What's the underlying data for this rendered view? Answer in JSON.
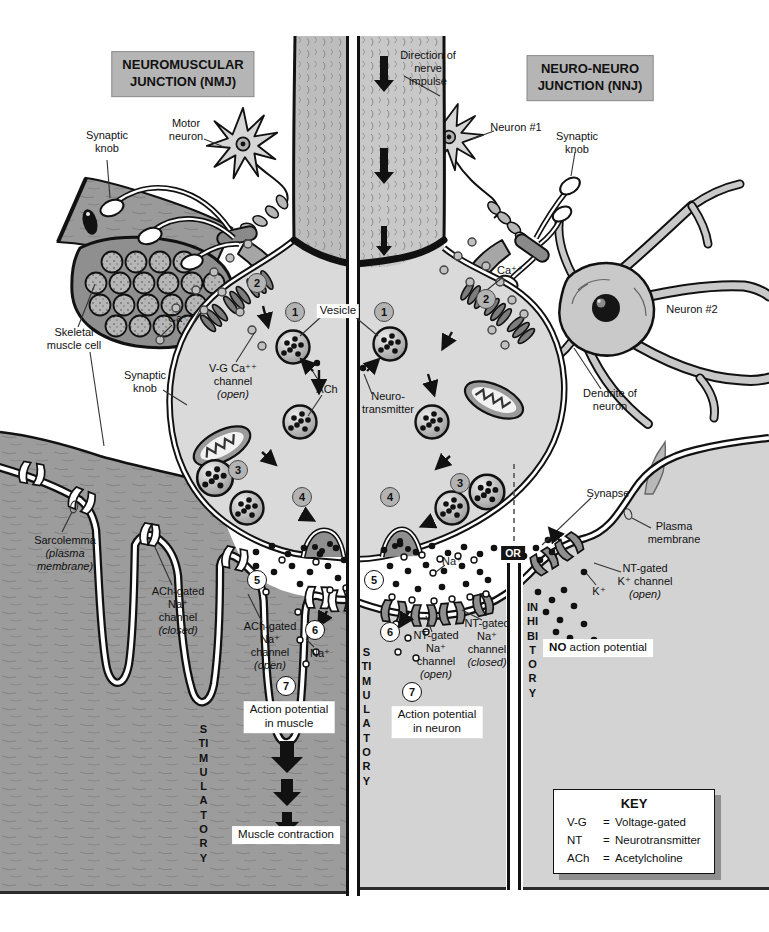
{
  "colors": {
    "page_bg": "#ffffff",
    "muscle_gray": "#9c9c9c",
    "dendrite_gray": "#d3d3d3",
    "knob_gray": "#dadada",
    "header_bg": "#b5b5b5",
    "badge_bg": "#151515",
    "ink": "#111111"
  },
  "titles": {
    "nmj": "NEUROMUSCULAR\nJUNCTION (NMJ)",
    "nnj": "NEURO-NEURO\nJUNCTION (NNJ)"
  },
  "labels": {
    "direction_of_impulse": "Direction of\nnerve\nimpulse",
    "synaptic_knob_nmj": "Synaptic\nknob",
    "motor_neuron": "Motor\nneuron",
    "neuron_1": "Neuron #1",
    "synaptic_knob_nnj": "Synaptic\nknob",
    "neuron_2": "Neuron #2",
    "skeletal_muscle_cell": "Skeletal\nmuscle cell",
    "ca_ion": "Ca⁺⁺",
    "vesicle": "Vesicle",
    "ach": "ACh",
    "neurotransmitter": "Neuro-\ntransmitter",
    "synaptic_knob_mid": "Synaptic\nknob",
    "dendrite_of_neuron": "Dendrite of\nneuron",
    "synapse": "Synapse",
    "plasma_membrane": "Plasma\nmembrane",
    "na_ion": "Na⁺",
    "k_ion": "K⁺",
    "or": "OR",
    "action_potential_muscle": "Action potential\nin muscle",
    "action_potential_neuron": "Action potential\nin neuron",
    "muscle_contraction": "Muscle contraction",
    "stimulatory": "STIMULATORY",
    "inhibitory": "INHIBITORY"
  },
  "no_action_potential": {
    "bold": "NO",
    "rest": " action potential"
  },
  "sarcolemma": {
    "name": "Sarcolemma",
    "state": "(plasma\nmembrane)"
  },
  "channels": {
    "vg_ca": {
      "name": "V-G Ca⁺⁺\nchannel",
      "state": "(open)"
    },
    "ach_na_closed": {
      "name": "ACh-gated\nNa⁺\nchannel",
      "state": "(closed)"
    },
    "ach_na_open": {
      "name": "ACh-gated\nNa⁺\nchannel",
      "state": "(open)"
    },
    "nt_na_open": {
      "name": "NT-gated\nNa⁺\nchannel",
      "state": "(open)"
    },
    "nt_na_closed": {
      "name": "NT-gated\nNa⁺\nchannel",
      "state": "(closed)"
    },
    "nt_k_open": {
      "name": "NT-gated\nK⁺ channel",
      "state": "(open)"
    }
  },
  "steps": [
    "1",
    "2",
    "3",
    "4",
    "5",
    "6",
    "7"
  ],
  "key": {
    "title": "KEY",
    "separator": "=",
    "entries": [
      {
        "abbr": "V-G",
        "meaning": "Voltage-gated"
      },
      {
        "abbr": "NT",
        "meaning": "Neurotransmitter"
      },
      {
        "abbr": "ACh",
        "meaning": "Acetylcholine"
      }
    ]
  }
}
